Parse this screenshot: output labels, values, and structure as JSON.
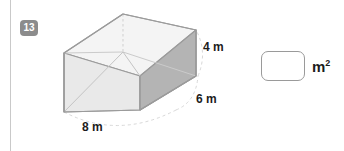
{
  "question": {
    "number": "13"
  },
  "figure": {
    "shape": "rectangular-prism",
    "labels": {
      "height": "4 m",
      "depth": "6 m",
      "width": "8 m"
    },
    "colors": {
      "edge": "#9b9b9b",
      "top_face": "#f2f2f2",
      "front_face": "#e6e6e6",
      "right_face": "#b4b4b4",
      "inner_edge": "#c8c8c8",
      "arc": "#d5d5d5"
    }
  },
  "answer": {
    "value": "",
    "placeholder": "",
    "unit": "m",
    "unit_exponent": "2"
  }
}
